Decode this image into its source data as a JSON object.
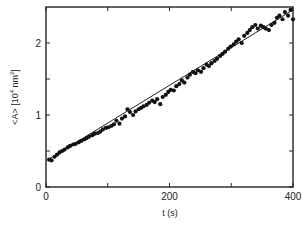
{
  "chart_data": {
    "type": "scatter",
    "title": "",
    "xlabel": "t (s)",
    "ylabel": "<A> [10⁴ nm²]",
    "ylabel_parts": {
      "main": "<A> [10",
      "exp1": "4",
      "mid": " nm",
      "exp2": "2",
      "end": "]"
    },
    "xlim": [
      0,
      400
    ],
    "ylim": [
      0,
      2.5
    ],
    "x_ticks": [
      0,
      100,
      200,
      300,
      400
    ],
    "x_tick_labels": [
      "0",
      "",
      "200",
      "",
      "400"
    ],
    "y_ticks": [
      0,
      0.5,
      1,
      1.5,
      2
    ],
    "y_tick_labels": [
      "0",
      "",
      "1",
      "",
      "2"
    ],
    "grid": false,
    "legend": null,
    "series": [
      {
        "name": "measured",
        "marker": "filled-circle",
        "x": [
          5,
          9,
          14,
          18,
          22,
          26,
          30,
          35,
          39,
          44,
          48,
          53,
          57,
          62,
          66,
          70,
          75,
          79,
          84,
          88,
          92,
          97,
          101,
          106,
          110,
          114,
          119,
          123,
          128,
          132,
          136,
          141,
          145,
          150,
          154,
          158,
          163,
          167,
          172,
          176,
          180,
          185,
          189,
          194,
          198,
          202,
          207,
          211,
          216,
          220,
          224,
          229,
          233,
          238,
          242,
          246,
          251,
          255,
          260,
          264,
          268,
          273,
          277,
          282,
          286,
          290,
          295,
          299,
          304,
          308,
          312,
          317,
          321,
          326,
          330,
          334,
          339,
          343,
          348,
          352,
          356,
          361,
          365,
          370,
          374,
          378,
          383,
          387,
          392,
          396,
          400
        ],
        "y": [
          0.38,
          0.37,
          0.42,
          0.45,
          0.48,
          0.5,
          0.52,
          0.55,
          0.57,
          0.59,
          0.6,
          0.62,
          0.64,
          0.66,
          0.68,
          0.7,
          0.72,
          0.74,
          0.75,
          0.77,
          0.8,
          0.82,
          0.83,
          0.85,
          0.87,
          0.92,
          0.88,
          0.95,
          0.98,
          1.08,
          1.04,
          1.0,
          1.05,
          1.08,
          1.1,
          1.12,
          1.14,
          1.17,
          1.2,
          1.18,
          1.22,
          1.15,
          1.25,
          1.28,
          1.32,
          1.35,
          1.34,
          1.4,
          1.43,
          1.48,
          1.45,
          1.52,
          1.56,
          1.6,
          1.58,
          1.62,
          1.6,
          1.65,
          1.7,
          1.68,
          1.72,
          1.75,
          1.78,
          1.82,
          1.85,
          1.88,
          1.92,
          1.95,
          1.98,
          2.02,
          2.05,
          2.0,
          2.1,
          2.14,
          2.18,
          2.22,
          2.25,
          2.2,
          2.24,
          2.22,
          2.2,
          2.18,
          2.25,
          2.28,
          2.35,
          2.38,
          2.33,
          2.43,
          2.38,
          2.46,
          2.33
        ]
      },
      {
        "name": "linear-fit",
        "type": "line",
        "x": [
          5,
          400
        ],
        "y": [
          0.39,
          2.46
        ]
      }
    ]
  }
}
